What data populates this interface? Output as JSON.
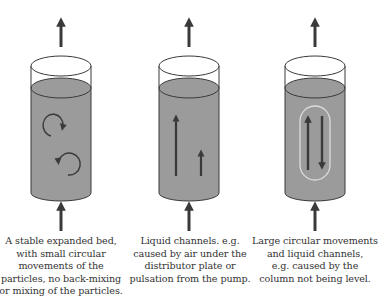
{
  "colors": {
    "liquid_fill": "#9b9b9b",
    "outline": "#3a3a3a",
    "arrow": "#3a3a3a",
    "channel_outline": "#d8d8d8",
    "background": "#ffffff"
  },
  "columns": [
    {
      "id": "stable-bed",
      "flow_pattern": "small circular movements",
      "inner_icons": [
        "clockwise-circular-arrow",
        "counterclockwise-circular-arrow"
      ],
      "caption_lines": [
        "A stable expanded bed,",
        "with small circular",
        "movements of the",
        "particles, no back-mixing",
        "or mixing of the particles."
      ]
    },
    {
      "id": "liquid-channels",
      "flow_pattern": "upward liquid channels",
      "inner_icons": [
        "long-up-arrow",
        "short-up-arrow"
      ],
      "caption_lines": [
        "Liquid channels. e.g.",
        "caused by air under the",
        "distributor plate or",
        "pulsation from the pump."
      ]
    },
    {
      "id": "large-circular",
      "flow_pattern": "large circular movement with channel",
      "inner_icons": [
        "up-arrow",
        "down-arrow",
        "loop-outline"
      ],
      "caption_lines": [
        "Large circular movements",
        "and liquid channels,",
        "e.g. caused by the",
        "column not being level."
      ]
    }
  ]
}
